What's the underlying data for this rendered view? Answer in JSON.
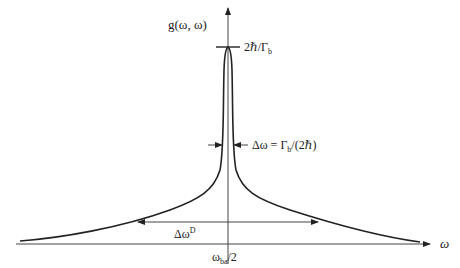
{
  "diagram": {
    "y_axis_label": "g(ω, ω)",
    "x_axis_label": "ω",
    "center_tick_label": "ω_ba/2",
    "center_tick_main": "ω",
    "center_tick_sub": "ba",
    "center_tick_tail": "/2",
    "peak_label_main": "2ℏ/Γ",
    "peak_label_sub": "b",
    "homogeneous_width_main": "Δω = Γ",
    "homogeneous_width_sub": "b",
    "homogeneous_width_tail": "/(2ℏ)",
    "doppler_width_main": "Δω",
    "doppler_width_sup": "D",
    "colors": {
      "line": "#222222",
      "axis": "#444444",
      "background": "#ffffff"
    }
  }
}
